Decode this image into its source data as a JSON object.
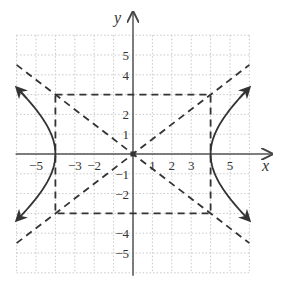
{
  "chart_data": {
    "type": "line",
    "title": "",
    "xlabel": "x",
    "ylabel": "y",
    "xlim": [
      -6,
      6
    ],
    "ylim": [
      -6,
      6
    ],
    "grid": true,
    "x_tick_labels": [
      "-5",
      "-3",
      "-2",
      "1",
      "2",
      "3",
      "5"
    ],
    "x_tick_values": [
      -5,
      -3,
      -2,
      1,
      2,
      3,
      5
    ],
    "y_tick_labels": [
      "5",
      "4",
      "2",
      "1",
      "-1",
      "-2",
      "-4",
      "-5"
    ],
    "y_tick_values": [
      5,
      4,
      2,
      1,
      -1,
      -2,
      -4,
      -5
    ],
    "equation": "x^2/16 - y^2/9 = 1",
    "vertices": [
      [
        -4,
        0
      ],
      [
        4,
        0
      ]
    ],
    "series": [
      {
        "name": "hyperbola right branch",
        "style": "solid",
        "points": [
          [
            6,
            3.354
          ],
          [
            5,
            2.25
          ],
          [
            4.5,
            1.546
          ],
          [
            4,
            0
          ],
          [
            4.5,
            -1.546
          ],
          [
            5,
            -2.25
          ],
          [
            6,
            -3.354
          ]
        ]
      },
      {
        "name": "hyperbola left branch",
        "style": "solid",
        "points": [
          [
            -6,
            3.354
          ],
          [
            -5,
            2.25
          ],
          [
            -4.5,
            1.546
          ],
          [
            -4,
            0
          ],
          [
            -4.5,
            -1.546
          ],
          [
            -5,
            -2.25
          ],
          [
            -6,
            -3.354
          ]
        ]
      },
      {
        "name": "asymptote y = 3/4 x",
        "style": "dashed",
        "points": [
          [
            -6,
            -4.5
          ],
          [
            6,
            4.5
          ]
        ]
      },
      {
        "name": "asymptote y = -3/4 x",
        "style": "dashed",
        "points": [
          [
            -6,
            4.5
          ],
          [
            6,
            -4.5
          ]
        ]
      },
      {
        "name": "central rectangle",
        "style": "dashed",
        "points": [
          [
            -4,
            3
          ],
          [
            4,
            3
          ],
          [
            4,
            -3
          ],
          [
            -4,
            -3
          ],
          [
            -4,
            3
          ]
        ]
      }
    ]
  },
  "labels": {
    "x_axis": "x",
    "y_axis": "y",
    "xticks": [
      {
        "v": -5,
        "t": "−5"
      },
      {
        "v": -3,
        "t": "−3"
      },
      {
        "v": -2,
        "t": "−2"
      },
      {
        "v": 1,
        "t": "1"
      },
      {
        "v": 2,
        "t": "2"
      },
      {
        "v": 3,
        "t": "3"
      },
      {
        "v": 5,
        "t": "5"
      }
    ],
    "yticks": [
      {
        "v": 5,
        "t": "5"
      },
      {
        "v": 4,
        "t": "4"
      },
      {
        "v": 2,
        "t": "2"
      },
      {
        "v": 1,
        "t": "1"
      },
      {
        "v": -1,
        "t": "−1"
      },
      {
        "v": -2,
        "t": "−2"
      },
      {
        "v": -4,
        "t": "−4"
      },
      {
        "v": -5,
        "t": "−5"
      }
    ]
  },
  "colors": {
    "axis": "#555555",
    "curve": "#333333",
    "dash": "#333333",
    "grid": "#c8c8c8"
  }
}
